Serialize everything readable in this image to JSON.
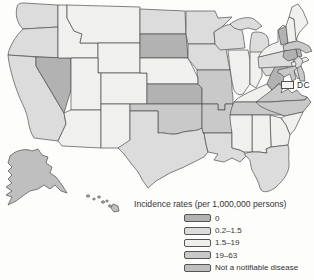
{
  "map": {
    "region_name": "United States choropleth map",
    "dc_label": "DC",
    "dc_fill": "#f3f3f1",
    "categories": [
      {
        "id": "zero",
        "label": "0",
        "color": "#b2b2b2"
      },
      {
        "id": "low",
        "label": "0.2–1.5",
        "color": "#dcdcdc"
      },
      {
        "id": "mid",
        "label": "1.5–19",
        "color": "#f0f0ee"
      },
      {
        "id": "high",
        "label": "19–63",
        "color": "#c9c9c9"
      },
      {
        "id": "nn",
        "label": "Not a notifiable disease",
        "color": "#bfbfbf"
      }
    ],
    "state_categories": {
      "WA": "low",
      "OR": "low",
      "CA": "low",
      "NV": "zero",
      "ID": "mid",
      "MT": "mid",
      "WY": "mid",
      "UT": "mid",
      "CO": "mid",
      "AZ": "mid",
      "NM": "mid",
      "ND": "low",
      "SD": "zero",
      "NE": "mid",
      "KS": "zero",
      "OK": "high",
      "TX": "low",
      "MN": "low",
      "IA": "low",
      "MO": "high",
      "AR": "high",
      "LA": "low",
      "WI": "low",
      "MI": "low",
      "IL": "mid",
      "IN": "mid",
      "OH": "low",
      "KY": "mid",
      "TN": "high",
      "MS": "mid",
      "AL": "mid",
      "GA": "mid",
      "FL": "low",
      "SC": "mid",
      "NC": "high",
      "VA": "high",
      "WV": "zero",
      "PA": "low",
      "NY": "mid",
      "NJ": "low",
      "DE": "high",
      "MD": "high",
      "VT": "zero",
      "NH": "mid",
      "ME": "mid",
      "MA": "high",
      "CT": "zero",
      "RI": "zero",
      "AK": "nn",
      "HI": "nn"
    }
  },
  "legend": {
    "title": "Incidence rates (per 1,000,000 persons)"
  }
}
